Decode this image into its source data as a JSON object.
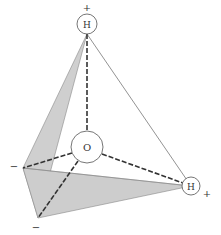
{
  "diagram": {
    "atoms": {
      "oxygen": {
        "label": "O",
        "cx": 87,
        "cy": 147,
        "r": 16
      },
      "hydrogen_top": {
        "label": "H",
        "cx": 87,
        "cy": 24,
        "r": 10,
        "charge": "+"
      },
      "hydrogen_right": {
        "label": "H",
        "cx": 191,
        "cy": 186,
        "r": 9,
        "charge": "+"
      }
    },
    "lone_pairs": {
      "left": {
        "x": 23,
        "y": 168,
        "charge": "−"
      },
      "bottom": {
        "x": 38,
        "y": 218,
        "charge": "−"
      }
    },
    "colors": {
      "fill": "#c8c8c8",
      "line": "#555555",
      "dash": "#333333"
    }
  }
}
